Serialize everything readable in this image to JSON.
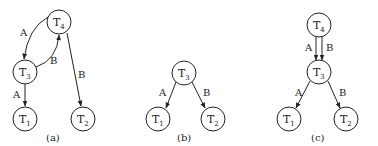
{
  "diagrams": [
    {
      "caption": "(a)",
      "nodes": [
        {
          "id": "T4",
          "base": "T",
          "sub": "4",
          "x": 59,
          "y": 22
        },
        {
          "id": "T3",
          "base": "T",
          "sub": "3",
          "x": 25,
          "y": 72
        },
        {
          "id": "T1",
          "base": "T",
          "sub": "1",
          "x": 25,
          "y": 119
        },
        {
          "id": "T2",
          "base": "T",
          "sub": "2",
          "x": 83,
          "y": 119
        }
      ],
      "edges": [
        {
          "from": "T4",
          "to": "T3",
          "label": "A",
          "curved": true
        },
        {
          "from": "T3",
          "to": "T4",
          "label": "B",
          "curved": true
        },
        {
          "from": "T3",
          "to": "T1",
          "label": "A"
        },
        {
          "from": "T4",
          "to": "T2",
          "label": "B"
        }
      ]
    },
    {
      "caption": "(b)",
      "nodes": [
        {
          "id": "T3",
          "base": "T",
          "sub": "3",
          "x": 184,
          "y": 73
        },
        {
          "id": "T1",
          "base": "T",
          "sub": "1",
          "x": 158,
          "y": 119
        },
        {
          "id": "T2",
          "base": "T",
          "sub": "2",
          "x": 213,
          "y": 119
        }
      ],
      "edges": [
        {
          "from": "T3",
          "to": "T1",
          "label": "A"
        },
        {
          "from": "T3",
          "to": "T2",
          "label": "B"
        }
      ]
    },
    {
      "caption": "(c)",
      "nodes": [
        {
          "id": "T4",
          "base": "T",
          "sub": "4",
          "x": 319,
          "y": 25
        },
        {
          "id": "T3",
          "base": "T",
          "sub": "3",
          "x": 319,
          "y": 72
        },
        {
          "id": "T1",
          "base": "T",
          "sub": "1",
          "x": 289,
          "y": 119
        },
        {
          "id": "T2",
          "base": "T",
          "sub": "2",
          "x": 346,
          "y": 119
        }
      ],
      "edges": [
        {
          "from": "T4",
          "to": "T3",
          "label": "A"
        },
        {
          "from": "T4",
          "to": "T3",
          "label": "B"
        },
        {
          "from": "T3",
          "to": "T1",
          "label": "A"
        },
        {
          "from": "T3",
          "to": "T2",
          "label": "B"
        }
      ]
    }
  ]
}
